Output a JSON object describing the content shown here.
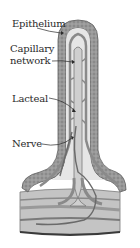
{
  "diagram": {
    "labels": [
      {
        "id": "epithelium",
        "text": "Epithelium"
      },
      {
        "id": "capillary",
        "text": "Capillary\nnetwork",
        "line1": "Capillary",
        "line2": "network"
      },
      {
        "id": "lacteal",
        "text": "Lacteal"
      },
      {
        "id": "nerve",
        "text": "Nerve"
      }
    ],
    "colors": {
      "epithelium": "#9a9a9a",
      "epithelium_dark": "#6e6e6e",
      "vessel": "#b4b4b4",
      "vessel_dark": "#7a7a7a",
      "lacteal": "#cfcfcf",
      "background": "#ffffff",
      "text": "#2a2a2a"
    }
  }
}
